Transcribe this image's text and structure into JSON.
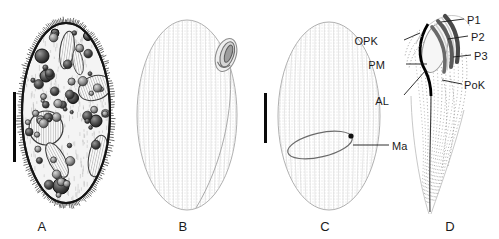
{
  "figure": {
    "background_color": "#ffffff",
    "ink_color": "#1a1a1a"
  },
  "panels": [
    {
      "id": "A",
      "letter": "A",
      "caption_x": 42,
      "caption_y": 219,
      "type": "detailed-cell-drawing",
      "description": "Ciliated ovoid cell with cortical granules, vacuoles and inclusions",
      "scalebar": {
        "present": true,
        "x": 13,
        "y": 92,
        "length": 70,
        "orientation": "vertical"
      }
    },
    {
      "id": "B",
      "letter": "B",
      "caption_x": 183,
      "caption_y": 219,
      "type": "outline-stippled",
      "description": "Stippled ovoid outline with spiral oral apparatus at upper right",
      "scalebar": {
        "present": false
      }
    },
    {
      "id": "C",
      "letter": "C",
      "caption_x": 325,
      "caption_y": 219,
      "type": "outline-stippled",
      "description": "Stippled ovoid outline with elongate macronucleus",
      "scalebar": {
        "present": true,
        "x": 264,
        "y": 93,
        "length": 50,
        "orientation": "vertical"
      }
    },
    {
      "id": "D",
      "letter": "D",
      "caption_x": 450,
      "caption_y": 219,
      "type": "oral-apparatus-detail",
      "description": "Infraciliature of the oral region with polykinetids and paroral membrane",
      "scalebar": {
        "present": false
      }
    }
  ],
  "annotations": [
    {
      "key": "ma",
      "label": "Ma",
      "panel": "C",
      "x": 392,
      "y": 140,
      "side": "right",
      "leader": {
        "x1": 389,
        "y1": 145,
        "x2": 353,
        "y2": 145
      }
    },
    {
      "key": "p1",
      "label": "P1",
      "panel": "D",
      "x": 467,
      "y": 14,
      "side": "right",
      "leader": {
        "x1": 464,
        "y1": 19,
        "x2": 441,
        "y2": 22
      }
    },
    {
      "key": "p2",
      "label": "P2",
      "panel": "D",
      "x": 471,
      "y": 31,
      "side": "right",
      "leader": {
        "x1": 468,
        "y1": 36,
        "x2": 448,
        "y2": 39
      }
    },
    {
      "key": "p3",
      "label": "P3",
      "panel": "D",
      "x": 474,
      "y": 50,
      "side": "right",
      "leader": {
        "x1": 471,
        "y1": 55,
        "x2": 453,
        "y2": 57
      }
    },
    {
      "key": "opk",
      "label": "OPK",
      "panel": "D",
      "x": 378,
      "y": 35,
      "side": "left",
      "leader": {
        "x1": 404,
        "y1": 40,
        "x2": 420,
        "y2": 33
      }
    },
    {
      "key": "pm",
      "label": "PM",
      "panel": "D",
      "x": 385,
      "y": 59,
      "side": "left",
      "leader": {
        "x1": 406,
        "y1": 64,
        "x2": 427,
        "y2": 64
      }
    },
    {
      "key": "al",
      "label": "AL",
      "panel": "D",
      "x": 389,
      "y": 95,
      "side": "left",
      "leader": {
        "x1": 404,
        "y1": 95,
        "x2": 426,
        "y2": 70
      }
    },
    {
      "key": "pok",
      "label": "PoK",
      "panel": "D",
      "x": 464,
      "y": 79,
      "side": "right",
      "leader": {
        "x1": 462,
        "y1": 84,
        "x2": 442,
        "y2": 80
      }
    }
  ]
}
